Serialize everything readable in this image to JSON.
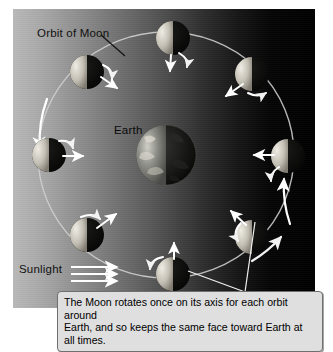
{
  "figure": {
    "title_label": "Orbit of Moon",
    "earth_label": "Earth",
    "sunlight_label": "Sunlight",
    "caption_line_1": "The Moon rotates once on its axis for each orbit around",
    "caption_line_2": "Earth, and so keeps the same face toward Earth at all times.",
    "caption_full": "The Moon rotates once on its axis for each orbit around Earth, and so keeps the same face toward Earth at all times."
  },
  "colors": {
    "sky_sunlit": "#b9b9b9",
    "sky_night": "#000000",
    "orbit_line": "#cfcfcf",
    "arrow": "#ffffff",
    "caption_bg": "#dfdfdf",
    "caption_border": "#6f6f6f",
    "text": "#111111",
    "moon_lit": "#d8d4cc",
    "moon_dark": "#0b0b0b",
    "earth_lit": "#9a9a94",
    "earth_dark": "#141414"
  },
  "diagram": {
    "type": "orbital-diagram",
    "sunlight_direction": "left-to-right",
    "sunlight_ray_count": 3,
    "orbit": {
      "center_x": 166,
      "center_y": 155,
      "radius_x": 128,
      "radius_y": 123,
      "direction": "counterclockwise"
    },
    "earth": {
      "center_x": 166,
      "center_y": 155,
      "radius": 30,
      "lit_side": "left"
    },
    "moons": [
      {
        "id": "moon-top",
        "angle_deg": 90,
        "x": 173,
        "y": 38,
        "radius": 17,
        "lit_side": "left",
        "axis_marker": "below",
        "spin_arrow": true
      },
      {
        "id": "moon-upper-left",
        "angle_deg": 135,
        "x": 87,
        "y": 72,
        "radius": 17,
        "lit_side": "left",
        "axis_marker": "right",
        "spin_arrow": true
      },
      {
        "id": "moon-left",
        "angle_deg": 180,
        "x": 49,
        "y": 155,
        "radius": 17,
        "lit_side": "left",
        "axis_marker": "right",
        "spin_arrow": true
      },
      {
        "id": "moon-lower-left",
        "angle_deg": 225,
        "x": 87,
        "y": 235,
        "radius": 17,
        "lit_side": "left",
        "axis_marker": "upper-right",
        "spin_arrow": true
      },
      {
        "id": "moon-bottom",
        "angle_deg": 270,
        "x": 173,
        "y": 274,
        "radius": 17,
        "lit_side": "left",
        "axis_marker": "above",
        "spin_arrow": true
      },
      {
        "id": "moon-lower-right",
        "angle_deg": 315,
        "x": 252,
        "y": 237,
        "radius": 17,
        "lit_side": "left",
        "axis_marker": "upper-left",
        "spin_arrow": true
      },
      {
        "id": "moon-right",
        "angle_deg": 0,
        "x": 288,
        "y": 156,
        "radius": 17,
        "lit_side": "left",
        "axis_marker": "left",
        "spin_arrow": true
      },
      {
        "id": "moon-upper-right",
        "angle_deg": 45,
        "x": 252,
        "y": 74,
        "radius": 17,
        "lit_side": "left",
        "axis_marker": "lower-left",
        "spin_arrow": true
      }
    ],
    "orbit_direction_arrows": 3
  }
}
